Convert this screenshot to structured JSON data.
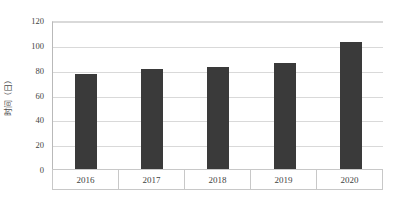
{
  "chart_data": {
    "type": "bar",
    "title": "",
    "xlabel": "",
    "ylabel": "时间（日）",
    "categories": [
      "2016",
      "2017",
      "2018",
      "2019",
      "2020"
    ],
    "values": [
      77,
      81,
      83,
      86.5,
      103.5
    ],
    "series": [
      {
        "name": "时间（日）",
        "values": [
          77,
          81,
          83,
          86.5,
          103.5
        ]
      }
    ],
    "ylim": [
      0,
      120
    ],
    "ytick_labels": [
      "0",
      "20",
      "40",
      "60",
      "80",
      "100",
      "120"
    ],
    "ytick_values": [
      0,
      20,
      40,
      60,
      80,
      100,
      120
    ],
    "grid": "horizontal",
    "legend": "none",
    "bar_color": "#3a3a3a",
    "gridline_color": "#d9d9d9",
    "axis_color": "#b0b0b0"
  }
}
